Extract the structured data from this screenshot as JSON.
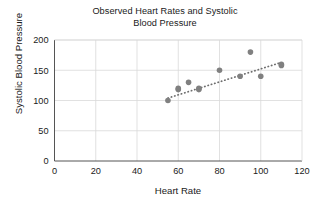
{
  "chart_data": {
    "type": "scatter",
    "title": "Observed Heart Rates and Systolic Blood Pressure",
    "title_lines": [
      "Observed Heart Rates and Systolic",
      "Blood Pressure"
    ],
    "xlabel": "Heart Rate",
    "ylabel": "Systolic Blood Pressure",
    "xlim": [
      0,
      120
    ],
    "ylim": [
      0,
      200
    ],
    "xticks": [
      0,
      20,
      40,
      60,
      80,
      100,
      120
    ],
    "yticks": [
      0,
      50,
      100,
      150,
      200
    ],
    "xtick_labels": [
      "0",
      "20",
      "40",
      "60",
      "80",
      "100",
      "120"
    ],
    "ytick_labels": [
      "0",
      "50",
      "100",
      "150",
      "200"
    ],
    "grid": true,
    "grid_color": "#d9d9d9",
    "legend": null,
    "marker_color": "#808080",
    "marker_size": 5,
    "x": [
      55,
      60,
      60,
      65,
      70,
      70,
      80,
      90,
      95,
      100,
      110,
      110
    ],
    "y": [
      100,
      118,
      120,
      130,
      118,
      120,
      150,
      140,
      180,
      140,
      158,
      160
    ],
    "points": [
      {
        "x": 55,
        "y": 100
      },
      {
        "x": 60,
        "y": 118
      },
      {
        "x": 60,
        "y": 120
      },
      {
        "x": 65,
        "y": 130
      },
      {
        "x": 70,
        "y": 118
      },
      {
        "x": 70,
        "y": 120
      },
      {
        "x": 80,
        "y": 150
      },
      {
        "x": 90,
        "y": 140
      },
      {
        "x": 95,
        "y": 180
      },
      {
        "x": 100,
        "y": 140
      },
      {
        "x": 110,
        "y": 158
      },
      {
        "x": 110,
        "y": 160
      }
    ],
    "trendline": {
      "style": "dotted",
      "color": "#6e6e6e",
      "x_start": 55,
      "y_start": 104,
      "x_end": 110,
      "y_end": 163
    }
  }
}
